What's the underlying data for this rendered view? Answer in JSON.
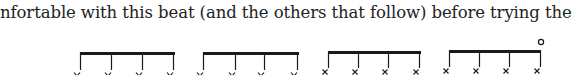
{
  "text": {
    "line": "nfortable with this beat (and the others that follow) before trying the chart"
  },
  "notation": {
    "description": "Four beamed groups of four notes each (drum notation)",
    "colors": {
      "ink": "#1a1a1a"
    },
    "groups": [
      {
        "beam_x1": 80,
        "beam_x2": 175,
        "beam_y": 52,
        "stems": [
          80,
          111,
          142,
          173
        ],
        "stem_bottom": 70,
        "note_glyph": "v",
        "accent_open": false
      },
      {
        "beam_x1": 203,
        "beam_x2": 299,
        "beam_y": 52,
        "stems": [
          203,
          235,
          264,
          297
        ],
        "stem_bottom": 70,
        "note_glyph": "v",
        "accent_open": false
      },
      {
        "beam_x1": 328,
        "beam_x2": 421,
        "beam_y": 51,
        "stems": [
          328,
          358,
          388,
          419
        ],
        "stem_bottom": 68,
        "note_glyph": "x",
        "accent_open": false
      },
      {
        "beam_x1": 449,
        "beam_x2": 541,
        "beam_y": 50,
        "stems": [
          449,
          479,
          509,
          540
        ],
        "stem_bottom": 67,
        "note_glyph": "x",
        "accent_open": true,
        "open_mark": "o"
      }
    ]
  }
}
